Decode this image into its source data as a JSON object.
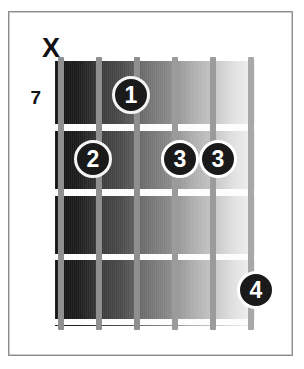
{
  "diagram": {
    "type": "guitar-chord-diagram",
    "instrument": "guitar",
    "string_count": 6,
    "fret_count": 4,
    "starting_fret_label": "7",
    "colors": {
      "frame_border": "#8d8d8d",
      "fret_line": "#fdfdfd",
      "string": "#8f8f8f",
      "marker_fill": "#1a1a1a",
      "marker_text": "#ffffff",
      "label_text": "#111111",
      "background": "#ffffff"
    },
    "strings": [
      {
        "index": 1,
        "x": 61,
        "thickness": 6,
        "shade": "#8f8f8f"
      },
      {
        "index": 2,
        "x": 99,
        "thickness": 6,
        "shade": "#8f8f8f"
      },
      {
        "index": 3,
        "x": 137,
        "thickness": 6,
        "shade": "#8f8f8f"
      },
      {
        "index": 4,
        "x": 175,
        "thickness": 5,
        "shade": "#9b9b9b"
      },
      {
        "index": 5,
        "x": 213,
        "thickness": 5,
        "shade": "#9b9b9b"
      },
      {
        "index": 6,
        "x": 251,
        "thickness": 5,
        "shade": "#a8a8a8"
      }
    ],
    "fret_lines": [
      {
        "index": 1,
        "y": 63
      },
      {
        "index": 2,
        "y": 128
      },
      {
        "index": 3,
        "y": 193
      },
      {
        "index": 4,
        "y": 258
      }
    ],
    "top_markers": [
      {
        "symbol": "X",
        "string": 1,
        "meaning": "muted",
        "x": 40,
        "y": 35
      }
    ],
    "fret_label": {
      "text": "7",
      "x": 27,
      "y": 88
    },
    "finger_markers": [
      {
        "finger": "1",
        "string": 3,
        "fret": 1,
        "x": 131,
        "y": 95
      },
      {
        "finger": "2",
        "string": 2,
        "fret": 2,
        "x": 93,
        "y": 159
      },
      {
        "finger": "3",
        "string": 4,
        "fret": 2,
        "x": 180,
        "y": 159
      },
      {
        "finger": "3",
        "string": 5,
        "fret": 2,
        "x": 218,
        "y": 159
      },
      {
        "finger": "4",
        "string": 6,
        "fret": 4,
        "x": 256,
        "y": 290
      }
    ]
  }
}
